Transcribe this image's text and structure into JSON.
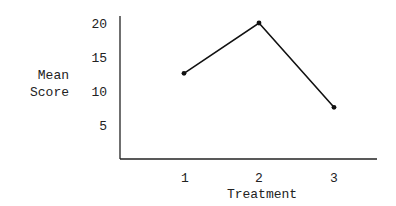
{
  "chart_data": {
    "type": "line",
    "title": "",
    "xlabel": "Treatment",
    "ylabel": "Mean Score",
    "ylabel_lines": [
      "Mean",
      "Score"
    ],
    "categories": [
      "1",
      "2",
      "3"
    ],
    "values": [
      12.6,
      20,
      7.6
    ],
    "yticks": [
      5,
      10,
      15,
      20
    ],
    "ytick_labels": [
      "5",
      "10",
      "15",
      "20"
    ],
    "ylim": [
      0,
      21
    ],
    "grid": false,
    "legend": null,
    "markers": true,
    "colors": {
      "line": "#111111",
      "axis": "#222222",
      "text": "#222222"
    }
  }
}
